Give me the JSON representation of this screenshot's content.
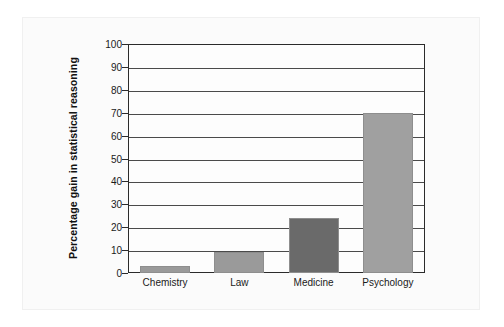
{
  "chart_data": {
    "type": "bar",
    "title": "",
    "xlabel": "",
    "ylabel": "Percentage gain in statistical reasoning",
    "categories": [
      "Chemistry",
      "Law",
      "Medicine",
      "Psychology"
    ],
    "values": [
      3,
      9,
      24,
      70
    ],
    "ylim": [
      0,
      100
    ],
    "ytick_labels": [
      "0",
      "10",
      "20",
      "30",
      "40",
      "50",
      "60",
      "70",
      "80",
      "90",
      "100"
    ],
    "ytick_values": [
      0,
      10,
      20,
      30,
      40,
      50,
      60,
      70,
      80,
      90,
      100
    ],
    "grid": "horizontal",
    "legend": "none",
    "bar_colors": [
      "#9a9a9a",
      "#9a9a9a",
      "#6a6a6a",
      "#a0a0a0"
    ],
    "series": [
      {
        "name": "Percentage gain in statistical reasoning",
        "values": [
          3,
          9,
          24,
          70
        ]
      }
    ]
  },
  "figure": {
    "background_color": "#fbfbfb",
    "frame_color": "#2b2b2b",
    "gridline_color": "#4a4a4a",
    "text_color": "#1a1a1a"
  }
}
